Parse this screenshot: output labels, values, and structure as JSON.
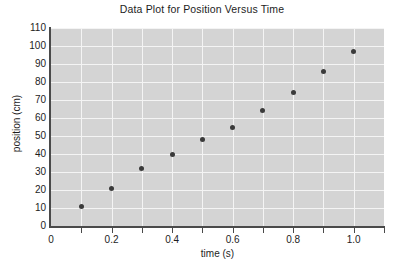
{
  "chart_data": {
    "type": "scatter",
    "title": "Data Plot for Position Versus Time",
    "xlabel": "time (s)",
    "ylabel": "position (cm)",
    "xlim": [
      0,
      1.1
    ],
    "ylim": [
      0,
      110
    ],
    "grid": true,
    "legend": "none",
    "plot_background": "#d4d4d4",
    "gridline_color": "#f4f4f4",
    "marker_color": "#3a3a3a",
    "x": [
      0.1,
      0.2,
      0.3,
      0.4,
      0.5,
      0.6,
      0.7,
      0.8,
      0.9,
      1.0
    ],
    "y": [
      11,
      21,
      32,
      40,
      48,
      55,
      64,
      74,
      86,
      97
    ],
    "points": [
      {
        "x": 0.1,
        "y": 11
      },
      {
        "x": 0.2,
        "y": 21
      },
      {
        "x": 0.3,
        "y": 32
      },
      {
        "x": 0.4,
        "y": 40
      },
      {
        "x": 0.5,
        "y": 48
      },
      {
        "x": 0.6,
        "y": 55
      },
      {
        "x": 0.7,
        "y": 64
      },
      {
        "x": 0.8,
        "y": 74
      },
      {
        "x": 0.9,
        "y": 86
      },
      {
        "x": 1.0,
        "y": 97
      }
    ],
    "y_ticks": [
      0,
      10,
      20,
      30,
      40,
      50,
      60,
      70,
      80,
      90,
      100,
      110
    ],
    "y_tick_labels": [
      "0",
      "10",
      "20",
      "30",
      "40",
      "50",
      "60",
      "70",
      "80",
      "90",
      "100",
      "110"
    ],
    "x_ticks": [
      0,
      0.1,
      0.2,
      0.3,
      0.4,
      0.5,
      0.6,
      0.7,
      0.8,
      0.9,
      1.0,
      1.1
    ],
    "x_labeled_ticks": [
      0,
      0.2,
      0.4,
      0.6,
      0.8,
      1.0
    ],
    "x_tick_labels": [
      "0",
      "0.2",
      "0.4",
      "0.6",
      "0.8",
      "1.0"
    ]
  }
}
